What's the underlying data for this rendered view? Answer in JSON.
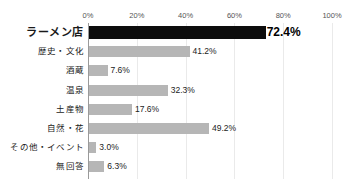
{
  "chart_data": {
    "type": "bar",
    "orientation": "horizontal",
    "title": "",
    "xlabel": "",
    "ylabel": "",
    "xlim": [
      0,
      100
    ],
    "grid": true,
    "legend": "none",
    "unit": "%",
    "categories": [
      "ラーメン店",
      "歴史・文化",
      "酒蔵",
      "温泉",
      "土産物",
      "自然・花",
      "その他・イベント",
      "無回答"
    ],
    "values": [
      72.4,
      41.2,
      7.6,
      32.3,
      17.6,
      49.2,
      3.0,
      6.3
    ],
    "value_labels": [
      "72.4%",
      "41.2%",
      "7.6%",
      "32.3%",
      "17.6%",
      "49.2%",
      "3.0%",
      "6.3%"
    ],
    "highlight_index": 0,
    "tick_values": [
      0,
      20,
      40,
      60,
      80,
      100
    ],
    "tick_labels": [
      "0%",
      "20%",
      "40%",
      "60%",
      "80%",
      "100%"
    ],
    "colors": {
      "bar": "#b6b6b6",
      "bar_highlight": "#0d0d0d",
      "gridline": "#eaeaea",
      "axis": "#9a9a9a",
      "text": "#1a1a1a",
      "background": "#ffffff"
    }
  }
}
